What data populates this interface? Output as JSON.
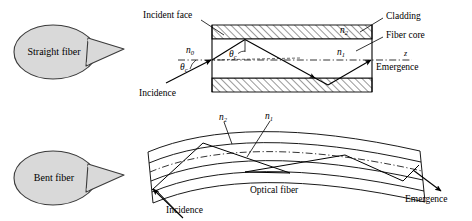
{
  "figure": {
    "background_color": "#ffffff",
    "line_color": "#000000",
    "bubble_fill": "#d9d9d9",
    "bubble_stroke": "#333333",
    "hatch_color": "#000000"
  },
  "panels": [
    {
      "id": "straight-fiber",
      "callout_label": "Straight fiber",
      "labels": {
        "incident_face": "Incident face",
        "incidence": "Incidence",
        "emergence": "Emergence",
        "cladding": "Cladding",
        "fiber_core": "Fiber core",
        "axis": "z",
        "n0": "n",
        "n0_sub": "0",
        "n1": "n",
        "n1_sub": "1",
        "n2": "n",
        "n2_sub": "2",
        "theta_outer": "θ",
        "theta_outer_sub": "c",
        "theta_inner": "θ",
        "theta_inner_sub": "c"
      }
    },
    {
      "id": "bent-fiber",
      "callout_label": "Bent fiber",
      "labels": {
        "incidence": "Incidence",
        "emergence": "Emergence",
        "optical_fiber": "Optical fiber",
        "n1": "n",
        "n1_sub": "1",
        "n2": "n",
        "n2_sub": "2"
      }
    }
  ]
}
